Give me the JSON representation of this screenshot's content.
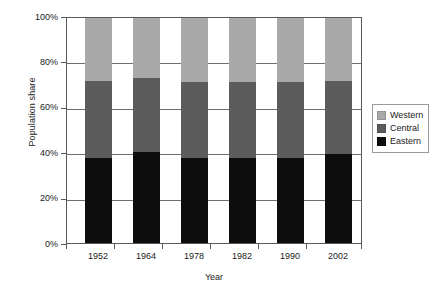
{
  "chart_data": {
    "type": "bar",
    "subtype": "stacked-percent",
    "title": "",
    "xlabel": "Year",
    "ylabel": "Population share",
    "categories": [
      "1952",
      "1964",
      "1978",
      "1982",
      "1990",
      "2002"
    ],
    "series": [
      {
        "name": "Eastern",
        "color": "#0d0d0d",
        "values": [
          38,
          40.5,
          38,
          38,
          38,
          39.5
        ]
      },
      {
        "name": "Central",
        "color": "#5c5c5c",
        "values": [
          34,
          33,
          33.5,
          33.5,
          33.5,
          32.5
        ]
      },
      {
        "name": "Western",
        "color": "#a9a9a9",
        "values": [
          28,
          26.5,
          28.5,
          28.5,
          28.5,
          28
        ]
      }
    ],
    "ylim": [
      0,
      100
    ],
    "yticks": [
      0,
      20,
      40,
      60,
      80,
      100
    ],
    "ytick_labels": [
      "0%",
      "20%",
      "40%",
      "60%",
      "80%",
      "100%"
    ],
    "grid": true,
    "grid_axis": "y",
    "legend_position": "right",
    "legend_entries": [
      {
        "label": "Western",
        "color": "#a9a9a9"
      },
      {
        "label": "Central",
        "color": "#5c5c5c"
      },
      {
        "label": "Eastern",
        "color": "#0d0d0d"
      }
    ]
  }
}
